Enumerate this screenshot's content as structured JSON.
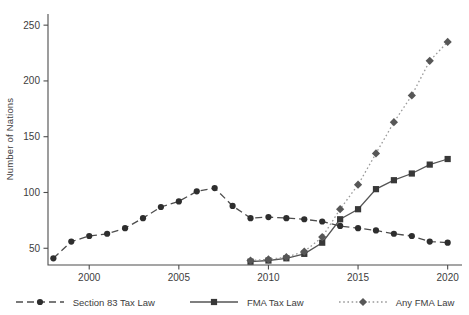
{
  "figure": {
    "background": "#ffffff",
    "axis_color": "#4d4d4d",
    "text_color": "#3d3d3d"
  },
  "chart_data": {
    "type": "line",
    "title": "",
    "xlabel": "",
    "ylabel": "Number of Nations",
    "x_ticks": [
      2000,
      2005,
      2010,
      2015,
      2020
    ],
    "y_ticks": [
      50,
      100,
      150,
      200,
      250
    ],
    "xlim": [
      1997.7,
      2020.8
    ],
    "ylim": [
      35,
      260
    ],
    "grid": false,
    "legend_position": "bottom",
    "series": [
      {
        "name": "Section 83 Tax Law",
        "marker": "circle",
        "line_style": "dashed",
        "line_color": "#4d4d4d",
        "marker_color": "#2e2e2e",
        "x": [
          1998,
          1999,
          2000,
          2001,
          2002,
          2003,
          2004,
          2005,
          2006,
          2007,
          2008,
          2009,
          2010,
          2011,
          2012,
          2013,
          2014,
          2015,
          2016,
          2017,
          2018,
          2019,
          2020
        ],
        "values": [
          41,
          56,
          61,
          63,
          68,
          77,
          87,
          92,
          101,
          104,
          88,
          77,
          78,
          77,
          76,
          74,
          70,
          68,
          66,
          63,
          61,
          56,
          55
        ]
      },
      {
        "name": "FMA Tax Law",
        "marker": "square",
        "line_style": "solid",
        "line_color": "#555555",
        "marker_color": "#383838",
        "x": [
          2009,
          2010,
          2011,
          2012,
          2013,
          2014,
          2015,
          2016,
          2017,
          2018,
          2019,
          2020
        ],
        "values": [
          38,
          39,
          41,
          45,
          55,
          76,
          85,
          103,
          111,
          117,
          125,
          130
        ]
      },
      {
        "name": "Any FMA Law",
        "marker": "diamond",
        "line_style": "dotted",
        "line_color": "#9a9a9a",
        "marker_color": "#575757",
        "x": [
          2009,
          2010,
          2011,
          2012,
          2013,
          2014,
          2015,
          2016,
          2017,
          2018,
          2019,
          2020
        ],
        "values": [
          39,
          40,
          42,
          47,
          60,
          85,
          107,
          135,
          163,
          187,
          218,
          235
        ]
      }
    ]
  }
}
